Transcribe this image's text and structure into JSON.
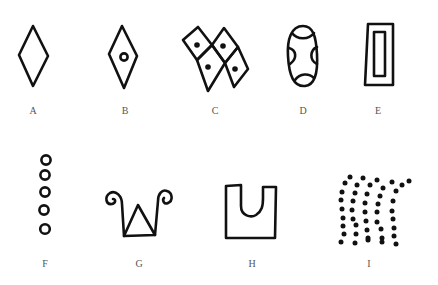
{
  "figure": {
    "type": "symbol-panel",
    "ink_color": "#111111",
    "background": "#ffffff",
    "label_color": "#555555",
    "symbols": [
      {
        "label": "A",
        "description": "plain rhombus (vertical diamond)"
      },
      {
        "label": "B",
        "description": "rhombus with small open circle in center"
      },
      {
        "label": "C",
        "description": "two pairs of tilted rhombi, each with a dot"
      },
      {
        "label": "D",
        "description": "oval with four curved arcs cut in at sides and ends"
      },
      {
        "label": "E",
        "description": "rectangle within a rectangle"
      },
      {
        "label": "F",
        "description": "vertical column of five small circles"
      },
      {
        "label": "G",
        "description": "triangle flanked by two spiral-topped stems"
      },
      {
        "label": "H",
        "description": "square with U-shaped notch at top"
      },
      {
        "label": "I",
        "description": "field of dots in curved vertical rows"
      }
    ]
  }
}
